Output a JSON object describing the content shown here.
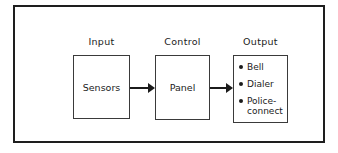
{
  "diagram": {
    "columns": [
      {
        "label": "Input",
        "box_text": "Sensors"
      },
      {
        "label": "Control",
        "box_text": "Panel"
      },
      {
        "label": "Output",
        "items": [
          "Bell",
          "Dialer",
          "Police-connect"
        ]
      }
    ],
    "arrows": [
      {
        "from": "Sensors",
        "to": "Panel"
      },
      {
        "from": "Panel",
        "to": "Output"
      }
    ]
  },
  "colors": {
    "ink": "#1b1b1b",
    "box-border": "#3a3a3a",
    "frame-border": "#1e1e1e",
    "paper": "#ffffff"
  }
}
